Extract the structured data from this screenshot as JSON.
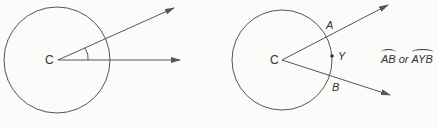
{
  "figures": [
    {
      "id": "central-angle",
      "center_label": "C",
      "circle": {
        "cx": 57,
        "cy": 60,
        "r": 53
      },
      "rays": [
        {
          "x2": 174,
          "y2": 8
        },
        {
          "x2": 180,
          "y2": 60
        }
      ]
    },
    {
      "id": "arc",
      "center_label": "C",
      "point_labels": {
        "a": "A",
        "y": "Y",
        "b": "B"
      },
      "arc_notation": {
        "first": "AB",
        "or": "or",
        "second": "AYB"
      },
      "circle": {
        "cx": 282,
        "cy": 60,
        "r": 50
      },
      "rays": [
        {
          "x2": 388,
          "y2": 5
        },
        {
          "x2": 390,
          "y2": 95
        }
      ]
    }
  ],
  "colors": {
    "stroke": "#555555",
    "text": "#333333"
  }
}
